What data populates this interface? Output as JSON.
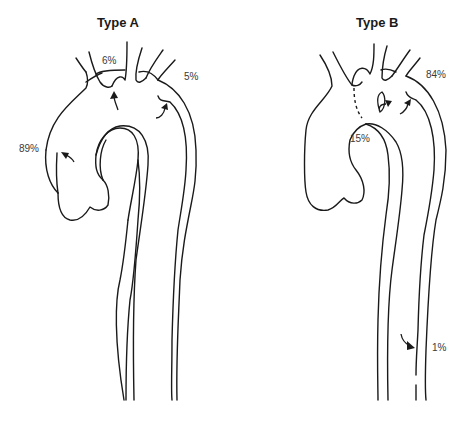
{
  "figure": {
    "panels": [
      {
        "title": "Type A",
        "labels": [
          {
            "id": "left-subclavian-entry",
            "text": "6%"
          },
          {
            "id": "descending-entry",
            "text": "5%"
          },
          {
            "id": "ascending-entry",
            "text": "89%"
          }
        ]
      },
      {
        "title": "Type B",
        "labels": [
          {
            "id": "arch-entry",
            "text": "84%"
          },
          {
            "id": "arch-inner-entry",
            "text": "15%"
          },
          {
            "id": "distal-descending-entry",
            "text": "1%"
          }
        ]
      }
    ],
    "colors": {
      "stroke": "#1a1a1a",
      "text": "#3a3a3a",
      "background": "#ffffff"
    }
  }
}
